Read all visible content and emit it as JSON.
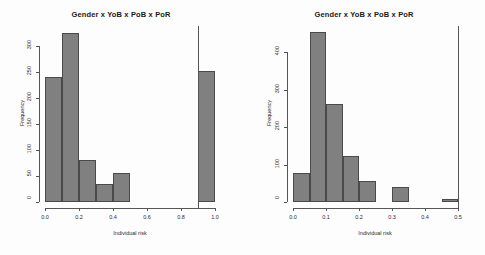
{
  "figure": {
    "background_color": "#fdfdfd",
    "bar_fill_color": "#808080",
    "bar_border_color": "#4a4a4a",
    "axis_color": "#555555"
  },
  "chart_data": [
    {
      "type": "bar",
      "panel": "left",
      "title": "Gender x YoB x PoB x PoR",
      "xlabel": "Individual risk",
      "ylabel": "Frequency",
      "xlim": [
        0.0,
        1.0
      ],
      "ylim": [
        0,
        330
      ],
      "grid": false,
      "legend": "none",
      "xticks": [
        0.0,
        0.2,
        0.4,
        0.6,
        0.8,
        1.0
      ],
      "xtick_labels": [
        "0.0",
        "0.2",
        "0.4",
        "0.6",
        "0.8",
        "1.0"
      ],
      "yticks": [
        0,
        50,
        100,
        150,
        200,
        250,
        300
      ],
      "ytick_labels": [
        "0",
        "50",
        "100",
        "150",
        "200",
        "250",
        "300"
      ],
      "bin_width": 0.1,
      "bins": [
        {
          "x0": 0.0,
          "x1": 0.1,
          "value": 240
        },
        {
          "x0": 0.1,
          "x1": 0.2,
          "value": 325
        },
        {
          "x0": 0.2,
          "x1": 0.3,
          "value": 80
        },
        {
          "x0": 0.3,
          "x1": 0.4,
          "value": 35
        },
        {
          "x0": 0.4,
          "x1": 0.5,
          "value": 55
        },
        {
          "x0": 0.5,
          "x1": 0.6,
          "value": 0
        },
        {
          "x0": 0.6,
          "x1": 0.7,
          "value": 0
        },
        {
          "x0": 0.7,
          "x1": 0.8,
          "value": 0
        },
        {
          "x0": 0.8,
          "x1": 0.9,
          "value": 0
        },
        {
          "x0": 0.9,
          "x1": 1.0,
          "value": 252
        }
      ],
      "reference_line_x": 0.9
    },
    {
      "type": "bar",
      "panel": "right",
      "title": "Gender x YoB x PoB x PoR",
      "xlabel": "Individual risk",
      "ylabel": "Frequency",
      "xlim": [
        0.0,
        0.5
      ],
      "ylim": [
        0,
        460
      ],
      "grid": false,
      "legend": "none",
      "xticks": [
        0.0,
        0.1,
        0.2,
        0.3,
        0.4,
        0.5
      ],
      "xtick_labels": [
        "0.0",
        "0.1",
        "0.2",
        "0.3",
        "0.4",
        "0.5"
      ],
      "yticks": [
        0,
        100,
        200,
        300,
        400
      ],
      "ytick_labels": [
        "0",
        "100",
        "200",
        "300",
        "400"
      ],
      "bin_width": 0.05,
      "bins": [
        {
          "x0": 0.0,
          "x1": 0.05,
          "value": 78
        },
        {
          "x0": 0.05,
          "x1": 0.1,
          "value": 455
        },
        {
          "x0": 0.1,
          "x1": 0.15,
          "value": 263
        },
        {
          "x0": 0.15,
          "x1": 0.2,
          "value": 123
        },
        {
          "x0": 0.2,
          "x1": 0.25,
          "value": 55
        },
        {
          "x0": 0.25,
          "x1": 0.3,
          "value": 0
        },
        {
          "x0": 0.3,
          "x1": 0.35,
          "value": 40
        },
        {
          "x0": 0.35,
          "x1": 0.4,
          "value": 0
        },
        {
          "x0": 0.4,
          "x1": 0.45,
          "value": 0
        },
        {
          "x0": 0.45,
          "x1": 0.5,
          "value": 9
        }
      ],
      "reference_line_x": 0.5
    }
  ]
}
